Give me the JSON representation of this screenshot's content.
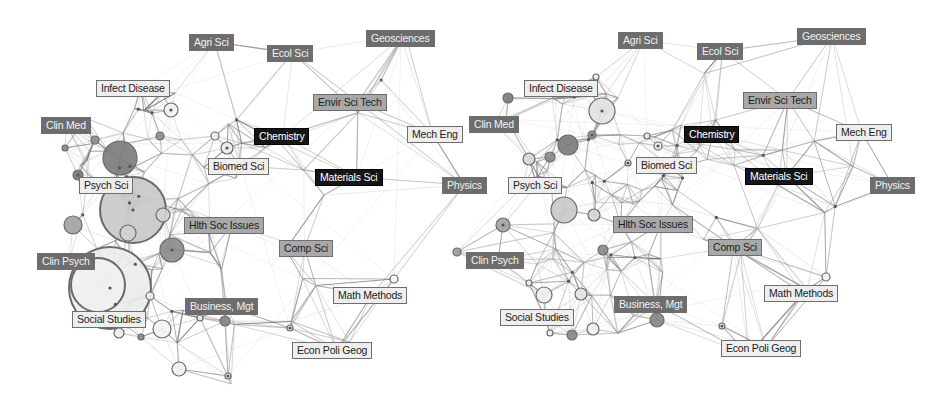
{
  "figure": {
    "panels": [
      {
        "id": "left",
        "labels": [
          {
            "text": "Agri Sci",
            "x": 189,
            "y": 34,
            "shade": "dark"
          },
          {
            "text": "Ecol Sci",
            "x": 267,
            "y": 45,
            "shade": "dark"
          },
          {
            "text": "Geosciences",
            "x": 366,
            "y": 30,
            "shade": "dark"
          },
          {
            "text": "Infect Disease",
            "x": 96,
            "y": 80,
            "shade": "light"
          },
          {
            "text": "Envir Sci Tech",
            "x": 313,
            "y": 94,
            "shade": "mid"
          },
          {
            "text": "Clin Med",
            "x": 41,
            "y": 117,
            "shade": "dark"
          },
          {
            "text": "Chemistry",
            "x": 254,
            "y": 128,
            "shade": "black"
          },
          {
            "text": "Mech Eng",
            "x": 407,
            "y": 126,
            "shade": "light"
          },
          {
            "text": "Biomed Sci",
            "x": 208,
            "y": 158,
            "shade": "light"
          },
          {
            "text": "Materials Sci",
            "x": 315,
            "y": 169,
            "shade": "black"
          },
          {
            "text": "Physics",
            "x": 442,
            "y": 177,
            "shade": "dark"
          },
          {
            "text": "Psych Sci",
            "x": 79,
            "y": 177,
            "shade": "light"
          },
          {
            "text": "Hlth Soc Issues",
            "x": 184,
            "y": 217,
            "shade": "mid"
          },
          {
            "text": "Comp Sci",
            "x": 279,
            "y": 240,
            "shade": "mid"
          },
          {
            "text": "Clin Psych",
            "x": 37,
            "y": 253,
            "shade": "dark"
          },
          {
            "text": "Math Methods",
            "x": 333,
            "y": 287,
            "shade": "light"
          },
          {
            "text": "Business, Mgt",
            "x": 185,
            "y": 298,
            "shade": "dark"
          },
          {
            "text": "Social Studies",
            "x": 72,
            "y": 311,
            "shade": "light"
          },
          {
            "text": "Econ Poli Geog",
            "x": 292,
            "y": 342,
            "shade": "light"
          }
        ],
        "nodes": [
          {
            "x": 120,
            "y": 158,
            "r": 17,
            "fill": "#7a7a7a"
          },
          {
            "x": 133,
            "y": 210,
            "r": 33,
            "fill": "#c8c8c8"
          },
          {
            "x": 110,
            "y": 288,
            "r": 41,
            "fill": "#ececec"
          },
          {
            "x": 98,
            "y": 285,
            "r": 27,
            "fill": "#efefef"
          },
          {
            "x": 172,
            "y": 250,
            "r": 12,
            "fill": "#8a8a8a"
          },
          {
            "x": 73,
            "y": 225,
            "r": 9,
            "fill": "#a2a2a2"
          },
          {
            "x": 128,
            "y": 233,
            "r": 8,
            "fill": "#d0d0d0"
          },
          {
            "x": 163,
            "y": 215,
            "r": 7,
            "fill": "#d4d4d4"
          },
          {
            "x": 162,
            "y": 329,
            "r": 9,
            "fill": "#f4f4f4"
          },
          {
            "x": 179,
            "y": 369,
            "r": 7,
            "fill": "#f2f2f2"
          },
          {
            "x": 171,
            "y": 110,
            "r": 7,
            "fill": "#f2f2f2"
          },
          {
            "x": 227,
            "y": 148,
            "r": 6,
            "fill": "#ededed"
          },
          {
            "x": 215,
            "y": 136,
            "r": 4,
            "fill": "#eeeeee"
          },
          {
            "x": 95,
            "y": 140,
            "r": 4,
            "fill": "#8d8d8d"
          },
          {
            "x": 65,
            "y": 148,
            "r": 3,
            "fill": "#888888"
          },
          {
            "x": 160,
            "y": 136,
            "r": 4,
            "fill": "#8d8d8d"
          },
          {
            "x": 78,
            "y": 175,
            "r": 5,
            "fill": "#777777"
          },
          {
            "x": 225,
            "y": 321,
            "r": 5,
            "fill": "#858585"
          },
          {
            "x": 200,
            "y": 318,
            "r": 3,
            "fill": "#f2f2f2"
          },
          {
            "x": 150,
            "y": 296,
            "r": 4,
            "fill": "#f0f0f0"
          },
          {
            "x": 119,
            "y": 333,
            "r": 5,
            "fill": "#f0f0f0"
          },
          {
            "x": 141,
            "y": 337,
            "r": 3,
            "fill": "#8a8a8a"
          },
          {
            "x": 394,
            "y": 279,
            "r": 4,
            "fill": "#f8f8f8"
          },
          {
            "x": 290,
            "y": 328,
            "r": 3,
            "fill": "#f5f5f5"
          },
          {
            "x": 228,
            "y": 376,
            "r": 3,
            "fill": "#f5f5f5"
          }
        ]
      },
      {
        "id": "right",
        "labels": [
          {
            "text": "Agri Sci",
            "x": 618,
            "y": 32,
            "shade": "dark"
          },
          {
            "text": "Ecol Sci",
            "x": 697,
            "y": 43,
            "shade": "dark"
          },
          {
            "text": "Geosciences",
            "x": 797,
            "y": 28,
            "shade": "dark"
          },
          {
            "text": "Infect Disease",
            "x": 524,
            "y": 80,
            "shade": "light"
          },
          {
            "text": "Envir Sci Tech",
            "x": 743,
            "y": 92,
            "shade": "mid"
          },
          {
            "text": "Clin Med",
            "x": 469,
            "y": 116,
            "shade": "dark"
          },
          {
            "text": "Chemistry",
            "x": 684,
            "y": 126,
            "shade": "black"
          },
          {
            "text": "Mech Eng",
            "x": 836,
            "y": 124,
            "shade": "light"
          },
          {
            "text": "Biomed Sci",
            "x": 636,
            "y": 157,
            "shade": "light"
          },
          {
            "text": "Materials Sci",
            "x": 745,
            "y": 168,
            "shade": "black"
          },
          {
            "text": "Physics",
            "x": 870,
            "y": 177,
            "shade": "dark"
          },
          {
            "text": "Psych Sci",
            "x": 508,
            "y": 177,
            "shade": "light"
          },
          {
            "text": "Hlth Soc Issues",
            "x": 613,
            "y": 216,
            "shade": "mid"
          },
          {
            "text": "Comp Sci",
            "x": 708,
            "y": 239,
            "shade": "mid"
          },
          {
            "text": "Clin Psych",
            "x": 466,
            "y": 252,
            "shade": "dark"
          },
          {
            "text": "Math Methods",
            "x": 764,
            "y": 285,
            "shade": "light"
          },
          {
            "text": "Business, Mgt",
            "x": 614,
            "y": 296,
            "shade": "dark"
          },
          {
            "text": "Social Studies",
            "x": 500,
            "y": 309,
            "shade": "light"
          },
          {
            "text": "Econ Poli Geog",
            "x": 721,
            "y": 340,
            "shade": "light"
          }
        ],
        "nodes": [
          {
            "x": 602,
            "y": 111,
            "r": 13,
            "fill": "#e2e2e2"
          },
          {
            "x": 568,
            "y": 145,
            "r": 10,
            "fill": "#7a7a7a"
          },
          {
            "x": 564,
            "y": 210,
            "r": 13,
            "fill": "#c8c8c8"
          },
          {
            "x": 508,
            "y": 98,
            "r": 5,
            "fill": "#7a7a7a"
          },
          {
            "x": 529,
            "y": 159,
            "r": 6,
            "fill": "#d8d8d8"
          },
          {
            "x": 550,
            "y": 157,
            "r": 5,
            "fill": "#8a8a8a"
          },
          {
            "x": 592,
            "y": 135,
            "r": 4,
            "fill": "#8d8d8d"
          },
          {
            "x": 503,
            "y": 225,
            "r": 7,
            "fill": "#a2a2a2"
          },
          {
            "x": 457,
            "y": 252,
            "r": 4,
            "fill": "#9a9a9a"
          },
          {
            "x": 594,
            "y": 215,
            "r": 6,
            "fill": "#d4d4d4"
          },
          {
            "x": 603,
            "y": 250,
            "r": 5,
            "fill": "#8a8a8a"
          },
          {
            "x": 544,
            "y": 295,
            "r": 8,
            "fill": "#eeeeee"
          },
          {
            "x": 529,
            "y": 283,
            "r": 3,
            "fill": "#f0f0f0"
          },
          {
            "x": 581,
            "y": 294,
            "r": 6,
            "fill": "#e6e6e6"
          },
          {
            "x": 593,
            "y": 329,
            "r": 6,
            "fill": "#f0f0f0"
          },
          {
            "x": 572,
            "y": 335,
            "r": 5,
            "fill": "#858585"
          },
          {
            "x": 550,
            "y": 333,
            "r": 3,
            "fill": "#f2f2f2"
          },
          {
            "x": 657,
            "y": 320,
            "r": 7,
            "fill": "#858585"
          },
          {
            "x": 658,
            "y": 146,
            "r": 4,
            "fill": "#ededed"
          },
          {
            "x": 647,
            "y": 136,
            "r": 3,
            "fill": "#eeeeee"
          },
          {
            "x": 628,
            "y": 163,
            "r": 3,
            "fill": "#f0f0f0"
          },
          {
            "x": 596,
            "y": 77,
            "r": 3,
            "fill": "#f0f0f0"
          },
          {
            "x": 826,
            "y": 277,
            "r": 4,
            "fill": "#f8f8f8"
          },
          {
            "x": 722,
            "y": 326,
            "r": 3,
            "fill": "#f5f5f5"
          }
        ]
      }
    ]
  }
}
